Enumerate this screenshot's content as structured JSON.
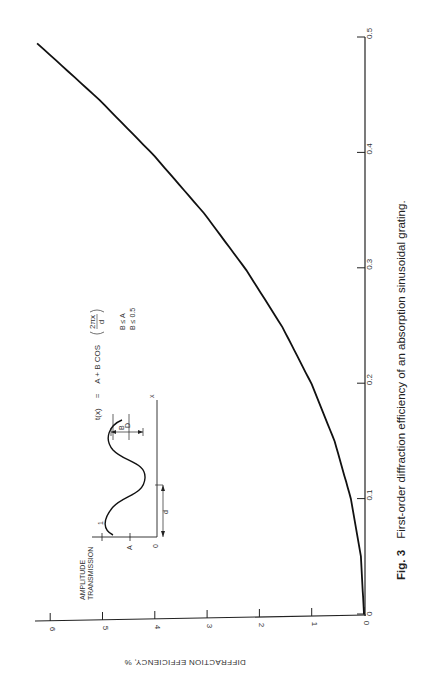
{
  "figure": {
    "label": "Fig. 3",
    "caption": "First-order diffraction efficiency of an absorption sinusoidal grating.",
    "formula": {
      "lhs": "t(x)",
      "eq": "=",
      "rhs": "A + B COS",
      "frac_num": "2πx",
      "frac_den": "d"
    },
    "conditions": [
      "B ≤ A",
      "B ≤ 0.5"
    ],
    "inset": {
      "ylabel_line1": "AMPLITUDE",
      "ylabel_line2": "TRANSMISSION",
      "tick_1": "1",
      "tick_A": "A",
      "tick_0": "0",
      "label_B": "B",
      "label_D": "D",
      "label_d": "d",
      "label_x": "x"
    }
  },
  "chart_data": {
    "type": "line",
    "title": "First-order diffraction efficiency of an absorption sinusoidal grating",
    "xlabel": "",
    "ylabel": "DIFFRACTION EFFICIENCY, %",
    "orientation": "rotated 90° clockwise on page",
    "xlim": [
      0,
      0.5
    ],
    "ylim": [
      0,
      6.5
    ],
    "x_ticks": [
      "0",
      "0.1",
      "0.2",
      "0.3",
      "0.4",
      "0.5"
    ],
    "y_ticks": [
      "0",
      "1",
      "2",
      "3",
      "4",
      "5",
      "6"
    ],
    "grid": false,
    "legend": null,
    "series": [
      {
        "name": "First-order efficiency",
        "x": [
          0,
          0.05,
          0.1,
          0.15,
          0.2,
          0.25,
          0.3,
          0.35,
          0.4,
          0.45,
          0.5
        ],
        "values": [
          0,
          0.06,
          0.25,
          0.56,
          1.0,
          1.56,
          2.25,
          3.06,
          4.0,
          5.06,
          6.25
        ]
      }
    ]
  },
  "axes": {
    "x_ticks": [
      {
        "label": "0",
        "value": 0
      },
      {
        "label": "0.1",
        "value": 0.1
      },
      {
        "label": "0.2",
        "value": 0.2
      },
      {
        "label": "0.3",
        "value": 0.3
      },
      {
        "label": "0.4",
        "value": 0.4
      },
      {
        "label": "0.5",
        "value": 0.5
      }
    ],
    "y_ticks": [
      {
        "label": "0",
        "value": 0
      },
      {
        "label": "1",
        "value": 1
      },
      {
        "label": "2",
        "value": 2
      },
      {
        "label": "3",
        "value": 3
      },
      {
        "label": "4",
        "value": 4
      },
      {
        "label": "5",
        "value": 5
      },
      {
        "label": "6",
        "value": 6
      }
    ],
    "ylabel": "DIFFRACTION EFFICIENCY, %"
  }
}
